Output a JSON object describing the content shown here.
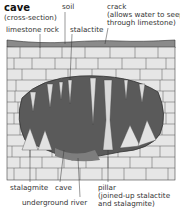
{
  "diagram": {
    "title": "cave",
    "subtitle": "(cross-section)",
    "labels": {
      "soil": "soil",
      "crack": "crack",
      "crack_note_1": "(allows water to seep",
      "crack_note_2": "through limestone)",
      "limestone": "limestone rock",
      "stalactite": "stalactite",
      "stalagmite": "stalagmite",
      "cave": "cave",
      "river": "underground river",
      "pillar": "pillar",
      "pillar_note_1": "(joined-up stalactite",
      "pillar_note_2": "and stalagmite)"
    }
  }
}
